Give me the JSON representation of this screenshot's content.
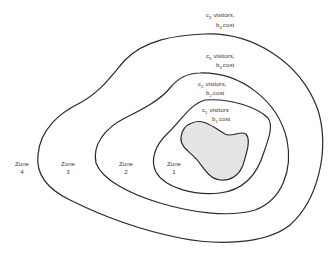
{
  "diagram": {
    "type": "concentric travel-cost zones",
    "shaded_area_fill": "#e4e4e4",
    "line_color": "#2a2a2a",
    "zones": [
      {
        "name": "Zone",
        "number": "1",
        "visitors_var": "c",
        "cost_var": "b",
        "index": "1",
        "visitors_word": "visitors",
        "cost_word": "cost"
      },
      {
        "name": "Zone",
        "number": "2",
        "visitors_var": "c",
        "cost_var": "b",
        "index": "2",
        "visitors_word": "visitors,",
        "cost_word": "cost"
      },
      {
        "name": "Zone",
        "number": "3",
        "visitors_var": "c",
        "cost_var": "b",
        "index": "3",
        "visitors_word": "visitors,",
        "cost_word": "cost"
      },
      {
        "name": "Zone",
        "number": "4",
        "visitors_var": "c",
        "cost_var": "b",
        "index": "4",
        "visitors_word": "visitors,",
        "cost_word": "cost"
      }
    ],
    "paths": {
      "outer_zone4": "M 205 34 C 250 32, 300 60, 318 110 C 330 150, 318 200, 290 225 C 265 245, 215 245, 180 238 C 140 230, 100 215, 70 200 C 45 188, 36 172, 38 155 C 40 128, 62 112, 78 104 C 100 93, 112 75, 125 60 C 145 40, 175 35, 205 34 Z",
      "zone3_boundary": "M 200 73 C 240 72, 278 100, 287 140 C 293 170, 282 200, 255 210 C 228 218, 190 212, 160 203 C 130 194, 102 180, 96 163 C 92 145, 105 128, 125 118 C 145 108, 160 100, 170 88 C 178 78, 188 73, 200 73 Z",
      "zone2_boundary": "M 205 100 C 232 98, 258 108, 268 118 C 273 125, 270 135, 264 152 C 258 172, 245 190, 220 193 C 195 196, 165 188, 156 172 C 150 160, 155 145, 168 133 C 180 122, 190 104, 205 100 Z",
      "shaded_blob": "M 192 123 C 202 118, 212 126, 225 134 C 232 138, 240 130, 246 134 C 251 140, 247 152, 243 165 C 239 176, 230 181, 220 180 C 210 179, 205 170, 198 161 C 191 152, 180 148, 181 137 C 182 129, 186 125, 192 123 Z"
    }
  }
}
